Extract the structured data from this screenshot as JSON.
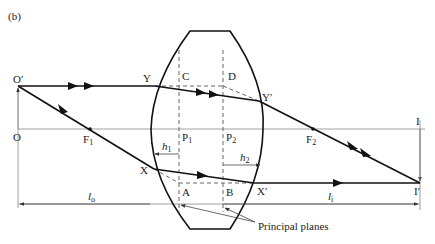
{
  "figure": {
    "panel_label": "(b)",
    "points": {
      "object_tip": "O′",
      "object_base": "O",
      "focal_1": "F",
      "focal_1_sub": "1",
      "focal_2": "F",
      "focal_2_sub": "2",
      "principal_1": "P",
      "principal_1_sub": "1",
      "principal_2": "P",
      "principal_2_sub": "2",
      "upper_entry": "Y",
      "upper_exit": "Y′",
      "lower_entry": "X",
      "lower_exit": "X′",
      "upper_plane_1": "C",
      "upper_plane_2": "D",
      "lower_plane_1": "A",
      "lower_plane_2": "B",
      "image_base": "I",
      "image_tip": "I′"
    },
    "distances": {
      "h1": "h",
      "h1_sub": "1",
      "h2": "h",
      "h2_sub": "2",
      "object_distance": "l",
      "object_distance_sub": "o",
      "image_distance": "l",
      "image_distance_sub": "i"
    },
    "callout": "Principal planes"
  }
}
